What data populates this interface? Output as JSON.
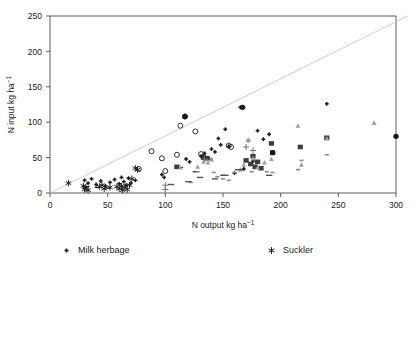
{
  "chart_data": {
    "type": "scatter",
    "title": "",
    "xlabel": "N output kg ha⁻¹",
    "ylabel": "N input kg ha⁻¹",
    "xlim": [
      0,
      300
    ],
    "ylim": [
      0,
      250
    ],
    "xticks": [
      0,
      50,
      100,
      150,
      200,
      250,
      300
    ],
    "yticks": [
      0,
      50,
      100,
      150,
      200,
      250
    ],
    "grid": false,
    "legend_position": "below-plot-two-columns",
    "reference_line": {
      "name": "diagonal-reference-line",
      "from": [
        0,
        0
      ],
      "to": [
        310,
        250
      ],
      "color": "#c8c8c8"
    },
    "series": [
      {
        "name": "Milk herbage",
        "marker": "small-plus",
        "color": "#1a1a1a",
        "points": [
          [
            30,
            18
          ],
          [
            33,
            14
          ],
          [
            36,
            20
          ],
          [
            40,
            12
          ],
          [
            44,
            17
          ],
          [
            48,
            10
          ],
          [
            52,
            15
          ],
          [
            56,
            19
          ],
          [
            60,
            13
          ],
          [
            62,
            22
          ],
          [
            64,
            16
          ],
          [
            66,
            11
          ],
          [
            68,
            21
          ],
          [
            70,
            14
          ],
          [
            74,
            18
          ],
          [
            97,
            26
          ],
          [
            99,
            22
          ],
          [
            118,
            48
          ],
          [
            121,
            44
          ],
          [
            131,
            52
          ],
          [
            134,
            56
          ],
          [
            137,
            50
          ],
          [
            140,
            62
          ],
          [
            143,
            58
          ],
          [
            146,
            77
          ],
          [
            148,
            68
          ],
          [
            152,
            90
          ],
          [
            155,
            66
          ],
          [
            160,
            28
          ],
          [
            165,
            121
          ],
          [
            168,
            34
          ],
          [
            172,
            74
          ],
          [
            176,
            45
          ],
          [
            180,
            88
          ],
          [
            185,
            76
          ],
          [
            190,
            83
          ],
          [
            193,
            57
          ],
          [
            240,
            126
          ]
        ]
      },
      {
        "name": "Suckler",
        "marker": "asterisk",
        "color": "#1a1a1a",
        "points": [
          [
            16,
            14
          ],
          [
            29,
            10
          ],
          [
            30,
            5
          ],
          [
            31,
            8
          ],
          [
            33,
            4
          ],
          [
            43,
            9
          ],
          [
            45,
            11
          ],
          [
            47,
            6
          ],
          [
            52,
            8
          ],
          [
            58,
            9
          ],
          [
            60,
            6
          ],
          [
            62,
            10
          ],
          [
            63,
            4
          ],
          [
            65,
            8
          ],
          [
            67,
            5
          ],
          [
            69,
            11
          ],
          [
            71,
            20
          ],
          [
            74,
            35
          ],
          [
            76,
            33
          ]
        ]
      },
      {
        "name": "Suckler-fattened off-soil",
        "marker": "dash",
        "color": "#1a1a1a",
        "points": [
          [
            32,
            9
          ],
          [
            41,
            8
          ],
          [
            50,
            7
          ],
          [
            113,
            36
          ],
          [
            126,
            30
          ],
          [
            139,
            48
          ],
          [
            150,
            25
          ],
          [
            166,
            33
          ],
          [
            178,
            35
          ]
        ]
      },
      {
        "name": "Milk + meat",
        "marker": "filled-square",
        "color": "#3d3d3d",
        "points": [
          [
            110,
            37
          ],
          [
            133,
            50
          ],
          [
            136,
            49
          ],
          [
            170,
            46
          ],
          [
            174,
            41
          ],
          [
            176,
            52
          ],
          [
            178,
            37
          ],
          [
            180,
            44
          ],
          [
            183,
            35
          ],
          [
            192,
            70
          ],
          [
            193,
            57
          ],
          [
            217,
            65
          ],
          [
            240,
            78
          ]
        ]
      },
      {
        "name": "Meat + crops",
        "marker": "open-circle",
        "color": "#1a1a1a",
        "points": [
          [
            77,
            34
          ],
          [
            88,
            59
          ],
          [
            97,
            49
          ],
          [
            100,
            31
          ],
          [
            110,
            54
          ],
          [
            113,
            95
          ],
          [
            117,
            108
          ],
          [
            126,
            87
          ],
          [
            131,
            55
          ],
          [
            133,
            51
          ],
          [
            155,
            67
          ],
          [
            157,
            65
          ]
        ]
      },
      {
        "name": "Fattened",
        "marker": "filled-circle",
        "color": "#1a1a1a",
        "points": [
          [
            117,
            108
          ],
          [
            167,
            121
          ],
          [
            193,
            57
          ],
          [
            300,
            80
          ]
        ]
      },
      {
        "name": "Specialized milk",
        "marker": "small-dash",
        "color": "#8c8c8c",
        "points": [
          [
            122,
            15
          ],
          [
            128,
            30
          ],
          [
            135,
            46
          ],
          [
            142,
            29
          ],
          [
            145,
            23
          ],
          [
            150,
            20
          ],
          [
            155,
            18
          ],
          [
            160,
            29
          ],
          [
            175,
            30
          ],
          [
            188,
            30
          ],
          [
            193,
            29
          ],
          [
            215,
            33
          ],
          [
            218,
            46
          ],
          [
            240,
            54
          ]
        ]
      },
      {
        "name": "Suckler-fattened herbage",
        "marker": "plus",
        "color": "#6b6b6b",
        "points": [
          [
            100,
            11
          ],
          [
            100,
            5
          ],
          [
            134,
            48
          ],
          [
            170,
            65
          ],
          [
            176,
            60
          ]
        ]
      },
      {
        "name": "Milk + crops",
        "marker": "small-triangle",
        "color": "#a0a0a0",
        "points": [
          [
            113,
            36
          ],
          [
            128,
            37
          ],
          [
            133,
            44
          ],
          [
            137,
            43
          ],
          [
            140,
            47
          ],
          [
            165,
            33
          ],
          [
            168,
            40
          ],
          [
            172,
            75
          ],
          [
            176,
            49
          ],
          [
            180,
            36
          ],
          [
            186,
            43
          ],
          [
            192,
            48
          ],
          [
            215,
            95
          ],
          [
            218,
            40
          ],
          [
            240,
            77
          ],
          [
            281,
            99
          ]
        ]
      },
      {
        "name": "Suckler-fattened",
        "marker": "dash-wide",
        "color": "#555555",
        "points": [
          [
            105,
            12
          ],
          [
            120,
            16
          ],
          [
            130,
            22
          ],
          [
            143,
            20
          ],
          [
            152,
            25
          ],
          [
            163,
            33
          ],
          [
            190,
            25
          ]
        ]
      }
    ]
  },
  "legend": {
    "columns": [
      {
        "items": [
          {
            "label": "Milk herbage",
            "marker": "small-plus"
          },
          {
            "label": "Suckler",
            "marker": "asterisk"
          },
          {
            "label": "Suckler-fattened off-soil",
            "marker": "dash"
          },
          {
            "label": "Milk + meat",
            "marker": "filled-square"
          },
          {
            "label": "Meat + crops",
            "marker": "open-circle"
          }
        ]
      },
      {
        "items": [
          {
            "label": "Fattened",
            "marker": "filled-circle"
          },
          {
            "label": "Specialized milk",
            "marker": "small-dash"
          },
          {
            "label": "Suckler-fattened herbage",
            "marker": "plus"
          },
          {
            "label": "Milk + crops",
            "marker": "small-triangle"
          },
          {
            "label": "Suckler-fattened",
            "marker": "dash-wide"
          }
        ]
      }
    ]
  },
  "colors": {
    "axis": "#4d4d4d",
    "text": "#1a1a1a",
    "reference_line": "#c8c8c8",
    "background": "#ffffff"
  }
}
